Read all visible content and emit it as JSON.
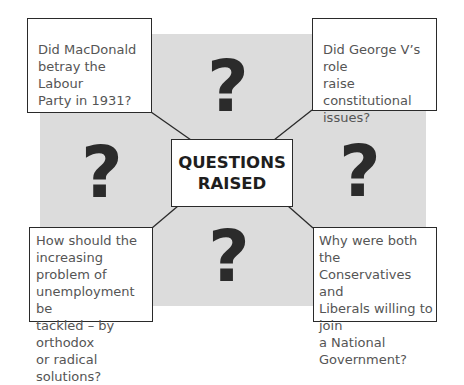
{
  "diagram": {
    "title_lines": [
      "QUESTIONS",
      "RAISED"
    ],
    "question_glyph": "?",
    "colors": {
      "panel_bg": "#dcdcdc",
      "box_border": "#2a2a2a",
      "question_text": "#555555",
      "question_mark": "#2b2b2b"
    },
    "questions": [
      {
        "position": "top-left",
        "text": "Did MacDonald\nbetray the Labour\nParty in 1931?"
      },
      {
        "position": "top-right",
        "text": "Did George V’s role\nraise constitutional\nissues?"
      },
      {
        "position": "bottom-left",
        "text": "How should the\nincreasing problem of\nunemployment be\ntackled – by orthodox\nor radical solutions?"
      },
      {
        "position": "bottom-right",
        "text": "Why were both the\nConservatives and\nLiberals willing to join\na National\nGovernment?"
      }
    ]
  }
}
